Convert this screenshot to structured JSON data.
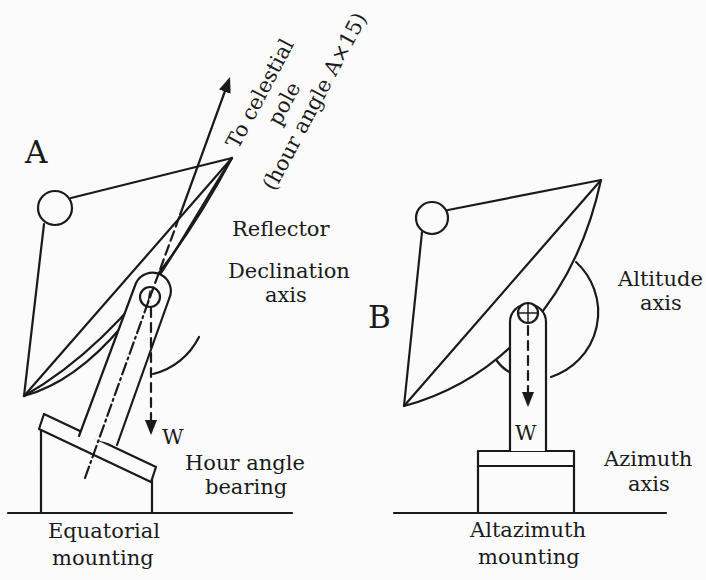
{
  "diagram": {
    "panels": [
      {
        "id": "A",
        "letter": "A",
        "pole_label": {
          "line1": "To celestial",
          "line2": "pole",
          "line3": "(hour angle A×15)"
        },
        "labels": {
          "reflector": "Reflector",
          "declination_1": "Declination",
          "declination_2": "axis",
          "weight": "W",
          "bearing_1": "Hour angle",
          "bearing_2": "bearing",
          "caption_1": "Equatorial",
          "caption_2": "mounting"
        }
      },
      {
        "id": "B",
        "letter": "B",
        "labels": {
          "altitude_1": "Altitude",
          "altitude_2": "axis",
          "weight": "W",
          "azimuth_1": "Azimuth",
          "azimuth_2": "axis",
          "caption_1": "Altazimuth",
          "caption_2": "mounting"
        }
      }
    ],
    "colors": {
      "ink": "#1a1a1a",
      "background": "#fbfbfb"
    }
  }
}
